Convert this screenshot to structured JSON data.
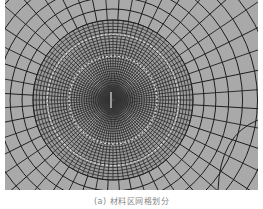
{
  "figure": {
    "background_color": "#a9a9a9",
    "line_color": "#1e1e1e",
    "center": [
      108,
      100
    ],
    "refined_radius": 80,
    "radial_line_count": 96,
    "ring_count": 34
  },
  "caption": "(a) 材料区网格划分"
}
